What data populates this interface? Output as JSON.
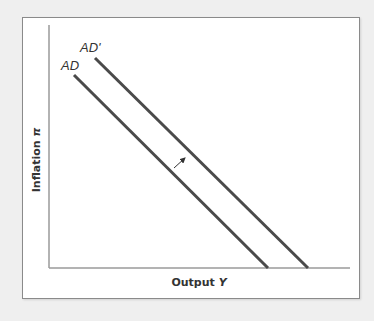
{
  "chart_data": {
    "type": "line",
    "title": "",
    "xlabel": "Output Y",
    "ylabel": "Inflation π",
    "xlabel_parts": {
      "text": "Output ",
      "var": "Y"
    },
    "ylabel_parts": {
      "text": "Inflation ",
      "var": "π"
    },
    "grid": false,
    "legend": "none",
    "ticks": "none",
    "series": [
      {
        "name": "AD",
        "label": "AD",
        "pixel_points": [
          [
            74,
            75
          ],
          [
            268,
            268
          ]
        ],
        "description": "Original aggregate demand curve, downward sloping"
      },
      {
        "name": "AD'",
        "label": "AD'",
        "pixel_points": [
          [
            95,
            58
          ],
          [
            308,
            268
          ]
        ],
        "description": "Shifted aggregate demand curve (rightward shift)"
      }
    ],
    "annotations": [
      {
        "type": "arrow",
        "from": [
          174,
          168
        ],
        "to": [
          186,
          157
        ],
        "meaning": "AD shifts right to AD'"
      }
    ],
    "axes": {
      "origin": [
        49,
        268
      ],
      "y_top": 25,
      "x_right": 350
    }
  },
  "colors": {
    "background": "#efefef",
    "plot_bg": "#ffffff",
    "frame": "#8a8a8a",
    "axis": "#9a9a9a",
    "curve": "#4a4a4a",
    "text": "#333333"
  }
}
